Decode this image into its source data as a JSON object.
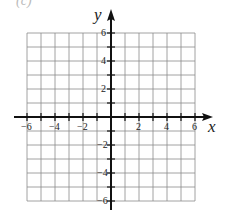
{
  "header": {
    "cropped_text": "(c)"
  },
  "chart_data": {
    "type": "scatter",
    "title": "",
    "xlabel": "x",
    "ylabel": "y",
    "xlim": [
      -6,
      6
    ],
    "ylim": [
      -6,
      6
    ],
    "grid": true,
    "grid_step": 1,
    "x_tick_labels": [
      "-6",
      "-4",
      "-2",
      "2",
      "4",
      "6"
    ],
    "x_tick_values": [
      -6,
      -4,
      -2,
      2,
      4,
      6
    ],
    "y_tick_labels": [
      "6",
      "4",
      "2",
      "-2",
      "-4",
      "-6"
    ],
    "y_tick_values": [
      6,
      4,
      2,
      -2,
      -4,
      -6
    ],
    "series": [],
    "axes_arrows": [
      "x-positive",
      "x-negative",
      "y-positive",
      "y-negative"
    ]
  },
  "colors": {
    "grid": "#8a8a8a",
    "axis": "#111111",
    "text": "#222222"
  }
}
